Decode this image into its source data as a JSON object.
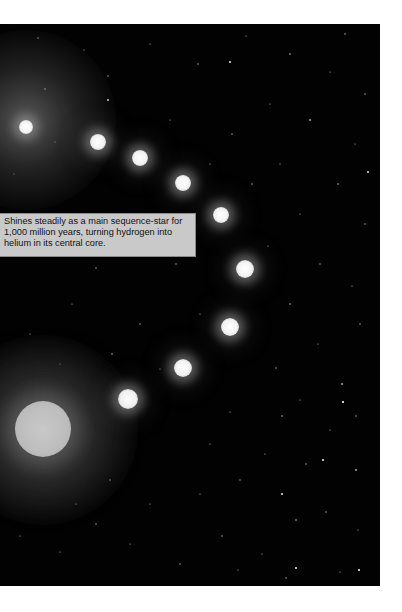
{
  "figure": {
    "caption": "Shines steadily as a main sequence-star for 1,000 million years, turning hydrogen into helium in its central core.",
    "background_color": "#020202",
    "caption_bg_color": "#c9c9c9",
    "stages": [
      {
        "name": "protostar-cloud",
        "x": 26,
        "y": 127,
        "r": 7
      },
      {
        "name": "young-star",
        "x": 98,
        "y": 142,
        "r": 8
      },
      {
        "name": "star-stage-3",
        "x": 140,
        "y": 158,
        "r": 8
      },
      {
        "name": "star-stage-4",
        "x": 183,
        "y": 183,
        "r": 8
      },
      {
        "name": "star-stage-5",
        "x": 221,
        "y": 215,
        "r": 8
      },
      {
        "name": "main-sequence-star",
        "x": 245,
        "y": 269,
        "r": 9
      },
      {
        "name": "star-stage-7",
        "x": 230,
        "y": 327,
        "r": 9
      },
      {
        "name": "star-stage-8",
        "x": 183,
        "y": 368,
        "r": 9
      },
      {
        "name": "star-stage-9",
        "x": 128,
        "y": 399,
        "r": 10
      },
      {
        "name": "red-giant",
        "x": 43,
        "y": 429,
        "r": 28
      }
    ]
  }
}
